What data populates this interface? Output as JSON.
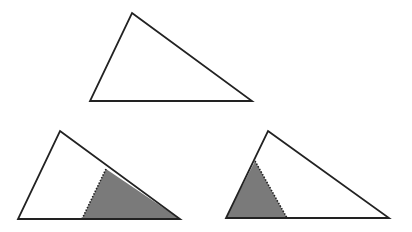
{
  "diagram": {
    "width": 412,
    "height": 232,
    "colors": {
      "stroke": "#222222",
      "fill": "#ffffff",
      "shade": "#7a7a7a",
      "background": "#ffffff"
    },
    "triangles": [
      {
        "id": "top-triangle",
        "points": [
          [
            132,
            13
          ],
          [
            252,
            101
          ],
          [
            90,
            101
          ]
        ],
        "shaded_region": null,
        "dotted_line": null
      },
      {
        "id": "bottom-left-triangle",
        "points": [
          [
            60,
            131
          ],
          [
            180,
            219
          ],
          [
            18,
            219
          ]
        ],
        "shaded_region": [
          [
            106,
            169
          ],
          [
            180,
            219
          ],
          [
            82,
            219
          ]
        ],
        "dotted_line": [
          [
            106,
            169
          ],
          [
            82,
            219
          ]
        ]
      },
      {
        "id": "bottom-right-triangle",
        "points": [
          [
            268,
            131
          ],
          [
            389,
            218
          ],
          [
            226,
            218
          ]
        ],
        "shaded_region": [
          [
            255,
            161
          ],
          [
            287,
            218
          ],
          [
            226,
            218
          ]
        ],
        "dotted_line": [
          [
            255,
            161
          ],
          [
            287,
            218
          ]
        ]
      }
    ]
  }
}
